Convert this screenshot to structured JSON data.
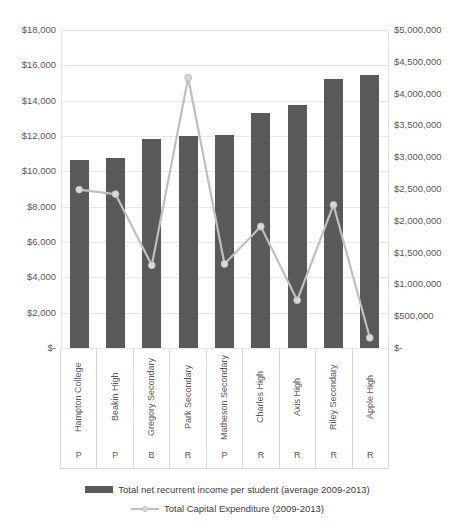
{
  "chart_data": {
    "type": "bar",
    "title": "",
    "subtitle": "",
    "xlabel": "",
    "ylabel": "",
    "grid": true,
    "legend_position": "bottom",
    "categories": [
      "Hampton College",
      "Beakin High",
      "Gregory Secondary",
      "Park Secondary",
      "Matheson Secondary",
      "Charles High",
      "Axis High",
      "Riley Secondary",
      "Apple High"
    ],
    "category_codes": [
      "P",
      "P",
      "B",
      "R",
      "P",
      "R",
      "R",
      "R",
      "R"
    ],
    "series": [
      {
        "name": "Total net recurrent income per student (average 2009-2013)",
        "type": "bar",
        "axis": "left",
        "color": "#595959",
        "values": [
          10650,
          10760,
          11840,
          12010,
          12070,
          13300,
          13760,
          15230,
          15450
        ]
      },
      {
        "name": "Total Capital Expenditure (2009-2013)",
        "type": "line",
        "axis": "right",
        "color": "#bfbfbf",
        "marker_color": "#d9d9d9",
        "values": [
          2490000,
          2420000,
          1300000,
          4250000,
          1320000,
          1910000,
          750000,
          2250000,
          160000
        ]
      }
    ],
    "axis_left": {
      "min": 0,
      "max": 18000,
      "step": 2000,
      "ticks": [
        "$18,000",
        "$16,000",
        "$14,000",
        "$12,000",
        "$10,000",
        "$8,000",
        "$6,000",
        "$4,000",
        "$2,000",
        "$-"
      ]
    },
    "axis_right": {
      "min": 0,
      "max": 5000000,
      "step": 500000,
      "ticks": [
        "$5,000,000",
        "$4,500,000",
        "$4,000,000",
        "$3,500,000",
        "$3,000,000",
        "$2,500,000",
        "$2,000,000",
        "$1,500,000",
        "$1,000,000",
        "$500,000",
        "$-"
      ]
    }
  },
  "legend": {
    "items": [
      {
        "label": "Total net recurrent income per student (average 2009-2013)",
        "marker": "bar-swatch"
      },
      {
        "label": "Total Capital Expenditure (2009-2013)",
        "marker": "line-marker-swatch"
      }
    ]
  },
  "colors": {
    "bar": "#595959",
    "line": "#bfbfbf",
    "marker": "#d9d9d9",
    "grid": "#e8e8e8",
    "text": "#595959",
    "background": "#ffffff"
  }
}
